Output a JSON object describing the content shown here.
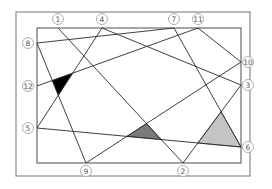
{
  "diagram": {
    "outer_frame": {
      "x": 16,
      "y": 12,
      "width": 234,
      "height": 164
    },
    "inner_frame": {
      "x": 37,
      "y": 28,
      "width": 204,
      "height": 135
    },
    "points": [
      {
        "id": "1",
        "label": "①",
        "x": 58,
        "y": 28,
        "label_x": 58,
        "label_y": 19
      },
      {
        "id": "2",
        "label": "②",
        "x": 183,
        "y": 163,
        "label_x": 183,
        "label_y": 171
      },
      {
        "id": "3",
        "label": "③",
        "x": 241,
        "y": 85,
        "label_x": 248,
        "label_y": 85
      },
      {
        "id": "4",
        "label": "④",
        "x": 102,
        "y": 28,
        "label_x": 102,
        "label_y": 19
      },
      {
        "id": "5",
        "label": "⑤",
        "x": 37,
        "y": 128,
        "label_x": 28,
        "label_y": 128
      },
      {
        "id": "6",
        "label": "⑥",
        "x": 241,
        "y": 147,
        "label_x": 248,
        "label_y": 147
      },
      {
        "id": "7",
        "label": "⑦",
        "x": 174,
        "y": 28,
        "label_x": 174,
        "label_y": 19
      },
      {
        "id": "8",
        "label": "⑧",
        "x": 37,
        "y": 43,
        "label_x": 28,
        "label_y": 43
      },
      {
        "id": "9",
        "label": "⑨",
        "x": 86,
        "y": 163,
        "label_x": 86,
        "label_y": 171
      },
      {
        "id": "10",
        "label": "⑩",
        "x": 241,
        "y": 62,
        "label_x": 248,
        "label_y": 62
      },
      {
        "id": "11",
        "label": "⑪",
        "x": 198,
        "y": 28,
        "label_x": 198,
        "label_y": 19
      },
      {
        "id": "12",
        "label": "⑫",
        "x": 37,
        "y": 86,
        "label_x": 28,
        "label_y": 86
      }
    ],
    "segments": [
      [
        "1",
        "2"
      ],
      [
        "4",
        "5"
      ],
      [
        "4",
        "3"
      ],
      [
        "8",
        "7"
      ],
      [
        "8",
        "9"
      ],
      [
        "12",
        "11"
      ],
      [
        "7",
        "6"
      ],
      [
        "11",
        "10"
      ],
      [
        "5",
        "6"
      ],
      [
        "9",
        "10"
      ],
      [
        "3",
        "2"
      ]
    ],
    "shaded_regions": [
      {
        "name": "black-triangle",
        "color": "#000000",
        "points": [
          [
            52.3,
            80.5
          ],
          [
            72.6,
            73.2
          ],
          [
            58.3,
            95.2
          ]
        ]
      },
      {
        "name": "dark-gray-triangle",
        "color": "#7a7a7a",
        "points": [
          [
            126.9,
            136.4
          ],
          [
            146.5,
            123.6
          ],
          [
            161.3,
            139.6
          ]
        ]
      },
      {
        "name": "light-gray-triangle",
        "color": "#c4c4c4",
        "points": [
          [
            221.1,
            111.7
          ],
          [
            241,
            147
          ],
          [
            197.8,
            143.0
          ]
        ]
      }
    ]
  }
}
